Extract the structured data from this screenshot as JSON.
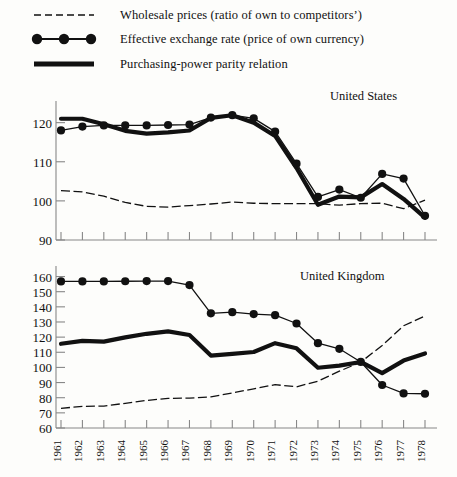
{
  "legend": {
    "items": [
      {
        "key": "dashed-line-key",
        "label": "Wholesale prices (ratio of own to competitors’)"
      },
      {
        "key": "dotted-line-key",
        "label": "Effective exchange rate (price of own currency)"
      },
      {
        "key": "thick-line-key",
        "label": "Purchasing-power parity relation"
      }
    ]
  },
  "chart_data": [
    {
      "type": "line",
      "title": "United States",
      "xlabel": "",
      "ylabel": "",
      "xlim": [
        1961,
        1978
      ],
      "ylim": [
        90,
        124
      ],
      "yticks": [
        90,
        100,
        110,
        120
      ],
      "grid": false,
      "legend_position": "top",
      "x": [
        1961,
        1962,
        1963,
        1964,
        1965,
        1966,
        1967,
        1968,
        1969,
        1970,
        1971,
        1972,
        1973,
        1974,
        1975,
        1976,
        1977,
        1978
      ],
      "series": [
        {
          "name": "Wholesale prices (ratio of own to competitors’)",
          "style": "dashed",
          "values": [
            102.6,
            102.3,
            101.2,
            99.6,
            98.6,
            98.4,
            98.8,
            99.2,
            99.7,
            99.4,
            99.3,
            99.3,
            99.3,
            98.9,
            99.3,
            99.4,
            98.0,
            100.2
          ]
        },
        {
          "name": "Effective exchange rate (price of own currency)",
          "style": "marker-line",
          "values": [
            118.0,
            119.0,
            119.3,
            119.3,
            119.3,
            119.4,
            119.5,
            121.3,
            121.9,
            121.1,
            117.7,
            109.5,
            101.0,
            102.9,
            100.8,
            106.9,
            105.7,
            96.2
          ]
        },
        {
          "name": "Purchasing-power parity relation",
          "style": "thick",
          "values": [
            121.0,
            121.0,
            119.6,
            117.9,
            117.2,
            117.5,
            118.0,
            121.2,
            121.9,
            120.0,
            116.6,
            108.4,
            99.0,
            101.1,
            100.9,
            104.3,
            100.5,
            95.7
          ]
        }
      ]
    },
    {
      "type": "line",
      "title": "United Kingdom",
      "xlabel": "",
      "ylabel": "",
      "xlim": [
        1961,
        1978
      ],
      "ylim": [
        60,
        163
      ],
      "yticks": [
        60,
        70,
        80,
        90,
        100,
        110,
        120,
        130,
        140,
        150,
        160
      ],
      "grid": false,
      "legend_position": "top",
      "x": [
        1961,
        1962,
        1963,
        1964,
        1965,
        1966,
        1967,
        1968,
        1969,
        1970,
        1971,
        1972,
        1973,
        1974,
        1975,
        1976,
        1977,
        1978
      ],
      "series": [
        {
          "name": "Wholesale prices (ratio of own to competitors’)",
          "style": "dashed",
          "values": [
            73.0,
            74.3,
            74.5,
            76.3,
            78.2,
            79.6,
            79.7,
            80.6,
            83.1,
            85.9,
            88.6,
            87.2,
            90.9,
            97.5,
            103.5,
            114.5,
            127.5,
            134.0
          ]
        },
        {
          "name": "Effective exchange rate (price of own currency)",
          "style": "marker-line",
          "values": [
            156.8,
            156.8,
            156.8,
            156.9,
            157.0,
            157.0,
            154.4,
            135.7,
            136.5,
            135.2,
            134.5,
            129.0,
            116.0,
            112.3,
            103.6,
            88.4,
            82.8,
            82.6
          ]
        },
        {
          "name": "Purchasing-power parity relation",
          "style": "thick",
          "values": [
            115.6,
            117.5,
            117.0,
            119.8,
            122.2,
            123.8,
            121.4,
            107.8,
            109.0,
            110.2,
            116.0,
            112.6,
            99.8,
            101.2,
            103.6,
            96.2,
            104.5,
            109.2
          ]
        }
      ]
    }
  ],
  "xaxis": {
    "labels": [
      "1961",
      "1962",
      "1963",
      "1964",
      "1965",
      "1966",
      "1967",
      "1968",
      "1969",
      "1970",
      "1971",
      "1972",
      "1973",
      "1974",
      "1975",
      "1976",
      "1977",
      "1978"
    ]
  },
  "colors": {
    "ink": "#111111",
    "axis": "#888888",
    "background": "#fdfdfb"
  }
}
